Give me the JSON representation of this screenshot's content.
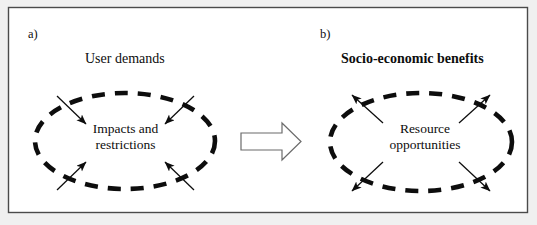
{
  "figure": {
    "background_color": "#f2f2f2",
    "canvas_color": "#ffffff",
    "border_color": "#4a4a4a",
    "ink_color": "#0d0d0d",
    "block_arrow_color": "#5a5a5a"
  },
  "panel_a": {
    "label": "a)",
    "heading": "User demands",
    "core_line_1": "Impacts and",
    "core_line_2": "restrictions",
    "core_text": "Impacts and restrictions",
    "arrow_direction": "inward",
    "arrow_count": 4
  },
  "panel_b": {
    "label": "b)",
    "heading": "Socio-economic benefits",
    "core_line_1": "Resource",
    "core_line_2": "opportunities",
    "core_text": "Resource opportunities",
    "arrow_direction": "outward",
    "arrow_count": 4
  },
  "transition": {
    "icon": "block-arrow-right-icon",
    "direction": "right"
  }
}
